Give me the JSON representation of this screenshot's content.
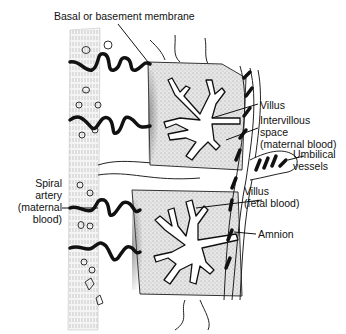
{
  "diagram": {
    "labels": {
      "basal_membrane": "Basal or basement membrane",
      "villus_top": "Villus",
      "intervillous_space": [
        "Intervillous",
        "space",
        "(maternal blood)"
      ],
      "umbilical_vessels": [
        "Umbilical",
        "vessels"
      ],
      "villus_bottom": [
        "Villus",
        "(fetal blood)"
      ],
      "amnion": "Amnion",
      "spiral_artery": [
        "Spiral",
        "artery",
        "(maternal",
        "blood)"
      ]
    },
    "colors": {
      "ink": "#111111",
      "stipple": "#c8c8c8",
      "stipple_dark": "#8a8a8a",
      "background": "#ffffff"
    }
  }
}
